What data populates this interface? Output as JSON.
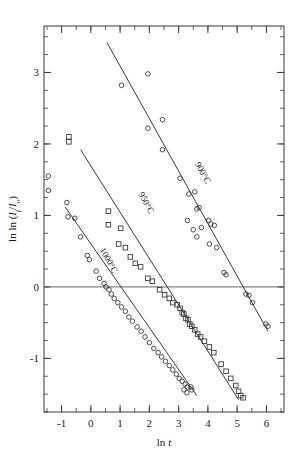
{
  "chart_data": {
    "type": "scatter",
    "title": "",
    "xlabel": "ln t",
    "ylabel": "ln ln (I_f/I_o)",
    "ylabel_parts": {
      "prefix": "ln ln (I",
      "sub1": "f",
      "mid": "/I",
      "sub2": "o",
      "suffix": ")"
    },
    "xlim": [
      -1.6,
      6.6
    ],
    "ylim": [
      -1.75,
      3.65
    ],
    "xticks": [
      -1,
      0,
      1,
      2,
      3,
      4,
      5,
      6
    ],
    "xticklabels": [
      "-1",
      "0",
      "1",
      "2",
      "3",
      "4",
      "5",
      "6"
    ],
    "yticks": [
      -1,
      0,
      1,
      2,
      3
    ],
    "yticklabels": [
      "-1",
      "0",
      "1",
      "2",
      "3"
    ],
    "minor_tick_step_x": 0.5,
    "minor_tick_step_y": 0.25,
    "grid": false,
    "legend_position": "inline-rotated-labels",
    "zero_line_y": 0,
    "frame": true,
    "series": [
      {
        "name": "900C",
        "label": "900°C",
        "marker": "circle",
        "label_x": 3.55,
        "label_y": 1.72,
        "label_rotation": 61,
        "fit": {
          "x1": 0.55,
          "y1": 3.42,
          "x2": 6.05,
          "y2": -0.62
        },
        "points": [
          [
            1.05,
            2.82
          ],
          [
            1.95,
            2.98
          ],
          [
            1.95,
            2.22
          ],
          [
            2.45,
            2.34
          ],
          [
            2.45,
            1.92
          ],
          [
            3.05,
            1.52
          ],
          [
            3.35,
            1.3
          ],
          [
            3.55,
            1.33
          ],
          [
            3.62,
            1.09
          ],
          [
            3.7,
            1.11
          ],
          [
            3.3,
            0.93
          ],
          [
            3.5,
            0.8
          ],
          [
            3.78,
            0.83
          ],
          [
            3.62,
            0.7
          ],
          [
            4.02,
            0.93
          ],
          [
            4.1,
            0.88
          ],
          [
            4.22,
            0.86
          ],
          [
            4.05,
            0.6
          ],
          [
            4.3,
            0.55
          ],
          [
            4.55,
            0.2
          ],
          [
            4.62,
            0.17
          ],
          [
            5.3,
            -0.1
          ],
          [
            5.4,
            -0.12
          ],
          [
            5.52,
            -0.22
          ],
          [
            5.98,
            -0.52
          ],
          [
            6.05,
            -0.55
          ]
        ]
      },
      {
        "name": "950C",
        "label": "950°C",
        "marker": "square",
        "label_x": 1.62,
        "label_y": 1.3,
        "label_rotation": 61,
        "fit": {
          "x1": -0.35,
          "y1": 1.92,
          "x2": 5.05,
          "y2": -1.58
        },
        "points": [
          [
            -0.75,
            2.1
          ],
          [
            -0.75,
            2.03
          ],
          [
            0.6,
            1.06
          ],
          [
            0.6,
            0.87
          ],
          [
            1.02,
            0.82
          ],
          [
            0.95,
            0.6
          ],
          [
            1.18,
            0.55
          ],
          [
            1.35,
            0.42
          ],
          [
            1.52,
            0.33
          ],
          [
            1.7,
            0.28
          ],
          [
            1.95,
            0.12
          ],
          [
            2.1,
            0.08
          ],
          [
            2.35,
            -0.04
          ],
          [
            2.52,
            -0.11
          ],
          [
            2.68,
            -0.16
          ],
          [
            2.8,
            -0.22
          ],
          [
            2.95,
            -0.25
          ],
          [
            3.05,
            -0.3
          ],
          [
            3.12,
            -0.36
          ],
          [
            3.18,
            -0.38
          ],
          [
            3.25,
            -0.44
          ],
          [
            3.32,
            -0.46
          ],
          [
            3.38,
            -0.52
          ],
          [
            3.45,
            -0.55
          ],
          [
            3.55,
            -0.6
          ],
          [
            3.65,
            -0.66
          ],
          [
            3.75,
            -0.7
          ],
          [
            3.88,
            -0.76
          ],
          [
            4.05,
            -0.84
          ],
          [
            4.2,
            -0.92
          ],
          [
            4.45,
            -1.08
          ],
          [
            4.62,
            -1.18
          ],
          [
            4.78,
            -1.28
          ],
          [
            4.95,
            -1.38
          ],
          [
            5.05,
            -1.46
          ],
          [
            5.12,
            -1.52
          ],
          [
            5.2,
            -1.55
          ]
        ]
      },
      {
        "name": "1000C",
        "label": "1000°C",
        "marker": "circle",
        "label_x": 0.3,
        "label_y": 0.52,
        "label_rotation": 61,
        "fit": {
          "x1": -0.88,
          "y1": 1.12,
          "x2": 3.62,
          "y2": -1.52
        },
        "points": [
          [
            -1.45,
            1.55
          ],
          [
            -1.45,
            1.35
          ],
          [
            -0.82,
            1.18
          ],
          [
            -0.78,
            0.98
          ],
          [
            -0.55,
            0.96
          ],
          [
            -0.35,
            0.7
          ],
          [
            -0.12,
            0.44
          ],
          [
            -0.05,
            0.38
          ],
          [
            0.18,
            0.22
          ],
          [
            0.3,
            0.12
          ],
          [
            0.45,
            0.05
          ],
          [
            0.52,
            0.0
          ],
          [
            0.62,
            -0.04
          ],
          [
            0.7,
            -0.1
          ],
          [
            0.8,
            -0.16
          ],
          [
            0.92,
            -0.22
          ],
          [
            1.05,
            -0.28
          ],
          [
            1.18,
            -0.34
          ],
          [
            1.3,
            -0.42
          ],
          [
            1.42,
            -0.48
          ],
          [
            1.58,
            -0.56
          ],
          [
            1.72,
            -0.62
          ],
          [
            1.85,
            -0.7
          ],
          [
            2.0,
            -0.78
          ],
          [
            2.15,
            -0.86
          ],
          [
            2.3,
            -0.92
          ],
          [
            2.42,
            -0.98
          ],
          [
            2.55,
            -1.04
          ],
          [
            2.68,
            -1.1
          ],
          [
            2.8,
            -1.16
          ],
          [
            2.92,
            -1.22
          ],
          [
            3.02,
            -1.28
          ],
          [
            3.12,
            -1.32
          ],
          [
            3.22,
            -1.36
          ],
          [
            3.3,
            -1.4
          ],
          [
            3.18,
            -1.44
          ],
          [
            3.42,
            -1.4
          ],
          [
            3.45,
            -1.44
          ],
          [
            3.28,
            -1.48
          ]
        ]
      }
    ]
  },
  "axes": {
    "x_title": "ln t",
    "y_title_prefix": "ln ln (",
    "y_title_i1": "I",
    "y_title_sub1": "f",
    "y_title_slash": "/",
    "y_title_i2": "I",
    "y_title_sub2": "o",
    "y_title_suffix": ")"
  },
  "colors": {
    "axis": "#3a3a3a",
    "marker": "#3a3a3a",
    "fit": "#3a3a3a",
    "background": "#ffffff",
    "text": "#1a1a1a"
  }
}
